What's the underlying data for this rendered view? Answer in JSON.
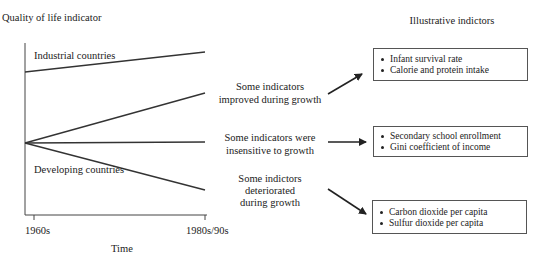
{
  "diagram": {
    "y_axis_label": "Quality of life indicator",
    "x_axis_label": "Time",
    "x_ticks": [
      "1960s",
      "1980s/90s"
    ],
    "right_title": "Illustrative indictors",
    "line_labels": {
      "industrial": "Industrial countries",
      "developing": "Developing countries"
    },
    "lines": [
      {
        "name": "industrial",
        "from": [
          25,
          72
        ],
        "to": [
          205,
          52
        ]
      },
      {
        "name": "improved",
        "from": [
          25,
          143
        ],
        "to": [
          205,
          93
        ]
      },
      {
        "name": "insensitive",
        "from": [
          25,
          143
        ],
        "to": [
          205,
          142
        ]
      },
      {
        "name": "deteriorated",
        "from": [
          25,
          143
        ],
        "to": [
          205,
          190
        ]
      }
    ],
    "categories": [
      {
        "label_lines": [
          "Some indicators",
          "improved during growth"
        ],
        "indicators": [
          "Infant survival rate",
          "Calorie and protein intake"
        ]
      },
      {
        "label_lines": [
          "Some indicators were",
          "insensitive to growth"
        ],
        "indicators": [
          "Secondary school enrollment",
          "Gini coefficient of income"
        ]
      },
      {
        "label_lines": [
          "Some indictors",
          "deteriorated",
          "during growth"
        ],
        "indicators": [
          "Carbon dioxide per capita",
          "Sulfur dioxide per capita"
        ]
      }
    ],
    "colors": {
      "line": "#333333",
      "text": "#222222",
      "box_border": "#555555"
    }
  }
}
